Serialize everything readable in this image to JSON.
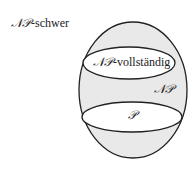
{
  "diagram": {
    "type": "set-inclusion (Euler diagram)",
    "colors": {
      "fill_np": "#e9e9e9",
      "fill_inner": "#ffffff",
      "stroke": "#222222"
    },
    "labels": {
      "np_hard_cal": "𝒩𝒫",
      "np_hard_suffix": "-schwer",
      "np_complete_cal": "𝒩𝒫",
      "np_complete_suffix": "-vollständig",
      "np": "𝒩𝒫",
      "p": "𝒫"
    }
  }
}
